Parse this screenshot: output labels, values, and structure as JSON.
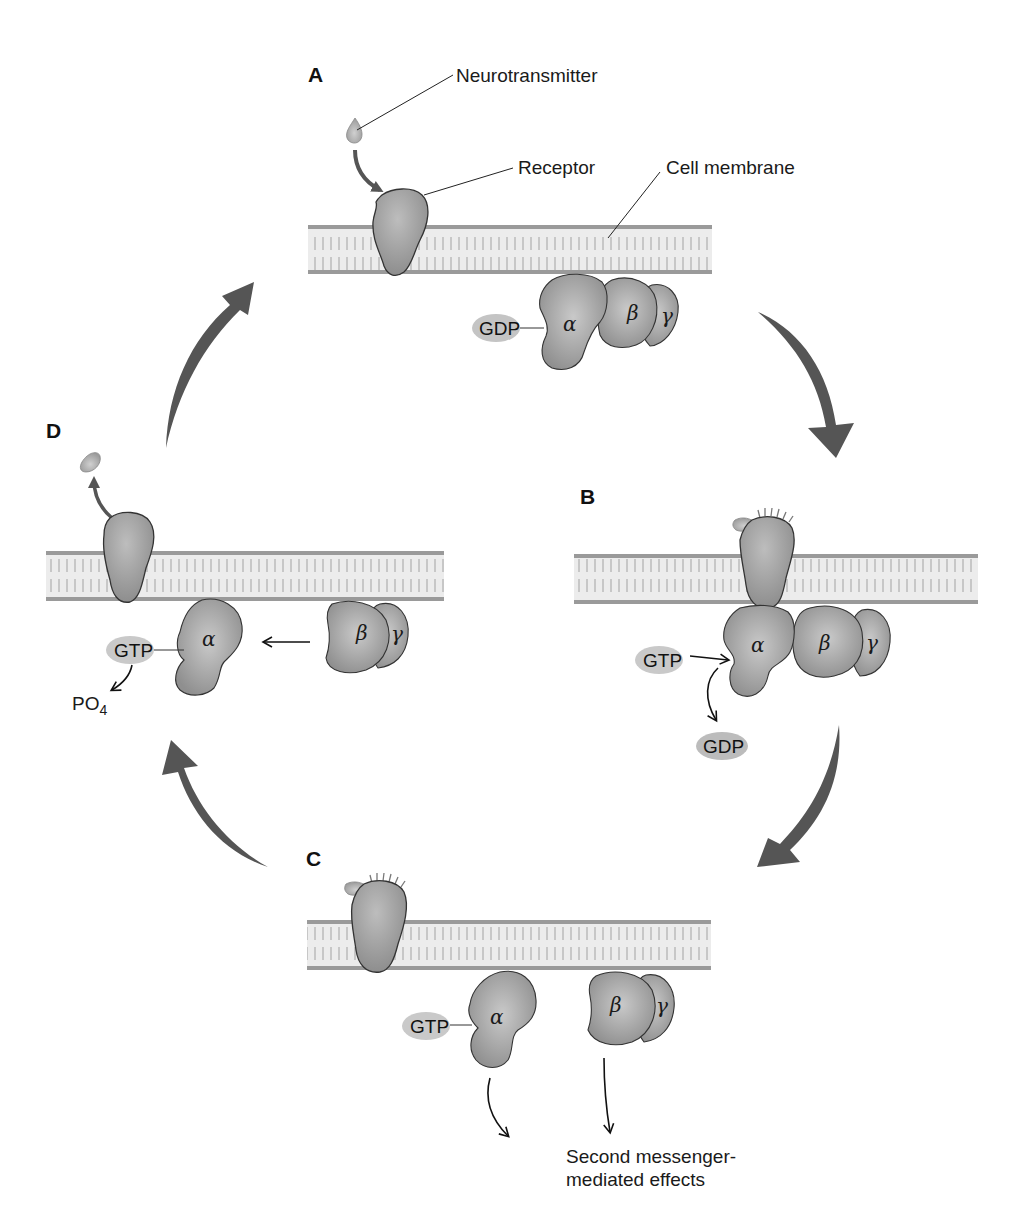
{
  "panels": {
    "A": {
      "label": "A",
      "bound_nucleotide": "GDP"
    },
    "B": {
      "label": "B",
      "incoming": "GTP",
      "released": "GDP"
    },
    "C": {
      "label": "C",
      "bound_nucleotide": "GTP",
      "effect_label_line1": "Second messenger-",
      "effect_label_line2": "mediated effects"
    },
    "D": {
      "label": "D",
      "bound_nucleotide": "GTP",
      "product": "PO",
      "product_subscript": "4"
    }
  },
  "annotations": {
    "neurotransmitter": "Neurotransmitter",
    "receptor": "Receptor",
    "cell_membrane": "Cell membrane"
  },
  "subunits": {
    "alpha": "α",
    "beta": "β",
    "gamma": "γ"
  },
  "colors": {
    "membrane_fill": "#e4e4e4",
    "membrane_edge": "#9a9a9a",
    "protein_fill": "#a8a8a8",
    "protein_edge": "#333333",
    "pill_fill": "#c4c4c4",
    "cycle_arrow": "#555555",
    "ligand": "#b0b0b0"
  }
}
